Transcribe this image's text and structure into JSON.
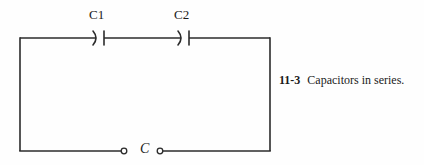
{
  "figure": {
    "caption_number": "11-3",
    "caption_text": "Capacitors in series.",
    "circuit": {
      "type": "series-capacitor-loop",
      "components": [
        {
          "id": "C1",
          "label": "C1",
          "kind": "capacitor",
          "symbol": "curved-plate-capacitor",
          "position": {
            "x": 100,
            "y": 38
          }
        },
        {
          "id": "C2",
          "label": "C2",
          "kind": "capacitor",
          "symbol": "curved-plate-capacitor",
          "position": {
            "x": 185,
            "y": 38
          }
        }
      ],
      "terminals": {
        "label": "C",
        "left_node": {
          "x": 124,
          "y": 151
        },
        "right_node": {
          "x": 160,
          "y": 151
        }
      },
      "loop": {
        "left": 20,
        "top": 38,
        "right": 270,
        "bottom": 151
      },
      "line_color": "#2b2b2b",
      "background_color": "#fefefe"
    }
  }
}
